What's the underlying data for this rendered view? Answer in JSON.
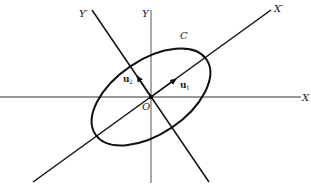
{
  "diagram": {
    "labels": {
      "x_axis": "X",
      "y_axis": "Y",
      "x_prime_axis": "X′",
      "y_prime_axis": "Y′",
      "curve": "C",
      "origin": "O",
      "u1_main": "u",
      "u1_sub": "1",
      "u2_main": "u",
      "u2_sub": "2"
    },
    "colors": {
      "stroke": "#111111",
      "axis_stroke": "#444444",
      "background": "#ffffff"
    }
  }
}
